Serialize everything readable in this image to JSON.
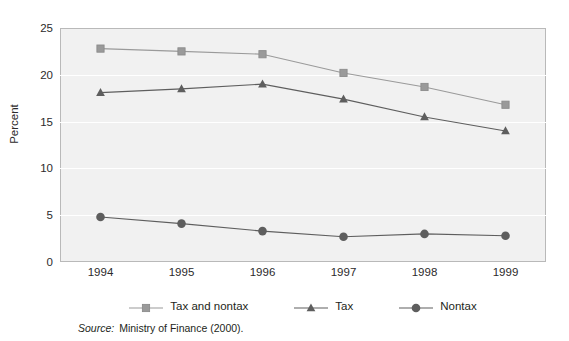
{
  "figure": {
    "ylabel": "Percent",
    "source_word": "Source:",
    "source_text": "Ministry of Finance (2000)."
  },
  "chart_data": {
    "type": "line",
    "title": "",
    "xlabel": "",
    "ylabel": "Percent",
    "categories": [
      "1994",
      "1995",
      "1996",
      "1997",
      "1998",
      "1999"
    ],
    "x": [
      1994,
      1995,
      1996,
      1997,
      1998,
      1999
    ],
    "yticks": [
      0,
      5,
      10,
      15,
      20,
      25
    ],
    "ylim": [
      0,
      25
    ],
    "grid": true,
    "legend_position": "bottom",
    "series": [
      {
        "name": "Tax and nontax",
        "marker": "square",
        "color": "#9a9a9a",
        "values": [
          22.8,
          22.5,
          22.2,
          20.2,
          18.7,
          16.8
        ]
      },
      {
        "name": "Tax",
        "marker": "triangle",
        "color": "#5e5e5e",
        "values": [
          18.1,
          18.5,
          19.0,
          17.4,
          15.5,
          14.0
        ]
      },
      {
        "name": "Nontax",
        "marker": "circle",
        "color": "#5e5e5e",
        "values": [
          4.8,
          4.1,
          3.3,
          2.7,
          3.0,
          2.8
        ]
      }
    ]
  }
}
